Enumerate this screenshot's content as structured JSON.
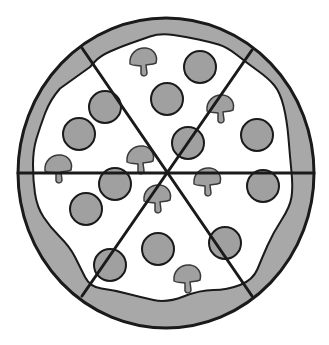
{
  "illustration": {
    "subject": "pizza",
    "slices": 6,
    "colors": {
      "background": "#ffffff",
      "crust": "#a8a8a8",
      "cheese": "#ffffff",
      "topping": "#a0a0a0",
      "outline": "#1a1a1a"
    },
    "pizza": {
      "cx": 166,
      "cy": 173,
      "rx": 148,
      "ry": 155
    },
    "cut_lines": [
      {
        "x1": 18,
        "y1": 173,
        "x2": 314,
        "y2": 173
      },
      {
        "x1": 82,
        "y1": 48,
        "x2": 252,
        "y2": 296
      },
      {
        "x1": 252,
        "y1": 50,
        "x2": 82,
        "y2": 296
      }
    ],
    "pepperoni": [
      {
        "cx": 200,
        "cy": 67,
        "r": 16
      },
      {
        "cx": 167,
        "cy": 99,
        "r": 16
      },
      {
        "cx": 105,
        "cy": 107,
        "r": 16
      },
      {
        "cx": 79,
        "cy": 134,
        "r": 16
      },
      {
        "cx": 188,
        "cy": 143,
        "r": 16
      },
      {
        "cx": 257,
        "cy": 135,
        "r": 16
      },
      {
        "cx": 115,
        "cy": 184,
        "r": 16
      },
      {
        "cx": 86,
        "cy": 209,
        "r": 16
      },
      {
        "cx": 263,
        "cy": 186,
        "r": 16
      },
      {
        "cx": 225,
        "cy": 243,
        "r": 16
      },
      {
        "cx": 158,
        "cy": 249,
        "r": 16
      },
      {
        "cx": 110,
        "cy": 265,
        "r": 16
      }
    ],
    "mushrooms": [
      {
        "x": 143,
        "y": 60
      },
      {
        "x": 220,
        "y": 107
      },
      {
        "x": 140,
        "y": 158
      },
      {
        "x": 58,
        "y": 167
      },
      {
        "x": 207,
        "y": 180
      },
      {
        "x": 157,
        "y": 197
      },
      {
        "x": 187,
        "y": 277
      }
    ]
  }
}
